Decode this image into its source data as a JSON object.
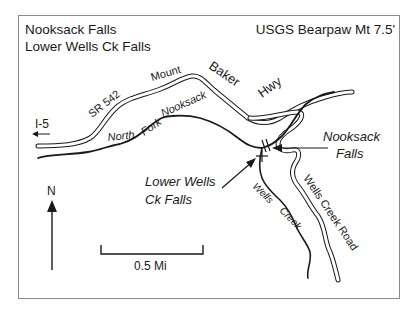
{
  "map": {
    "title_lines": [
      "Nooksack Falls",
      "Lower Wells Ck Falls"
    ],
    "quad": "USGS Bearpaw Mt 7.5'",
    "roads": {
      "sr542": "SR 542",
      "mount": "Mount",
      "baker": "Baker",
      "hwy": "Hwy",
      "i5": "I-5",
      "wells_creek_road": "Wells Creek Road"
    },
    "waterways": {
      "north": "North",
      "fork": "Fork",
      "nooksack": "Nooksack",
      "wells": "Wells",
      "creek": "Creek"
    },
    "falls": {
      "nooksack_line1": "Nooksack",
      "nooksack_line2": "Falls",
      "lower_wells_line1": "Lower Wells",
      "lower_wells_line2": "Ck Falls"
    },
    "north_arrow": "N",
    "scale": "0.5 Mi",
    "colors": {
      "ink": "#1a1a1a",
      "frame": "#8a8a8a",
      "background": "#ffffff"
    }
  }
}
